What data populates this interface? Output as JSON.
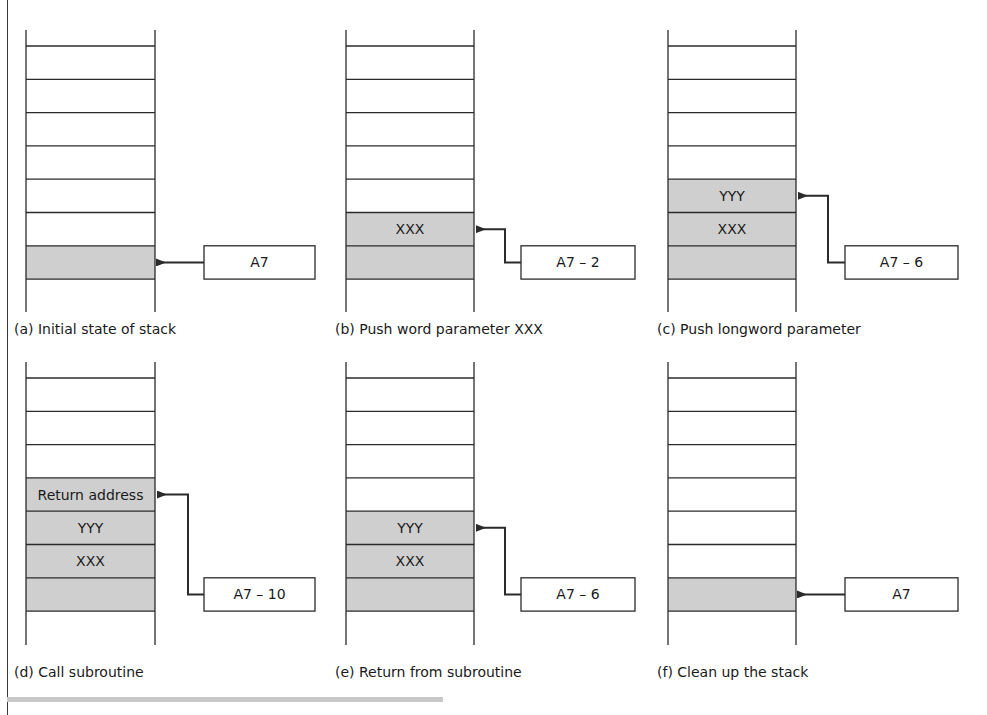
{
  "figure": {
    "colors": {
      "line": "#2b2b2b",
      "shade": "#cfcfcf",
      "background": "#ffffff",
      "bottom_bar": "#c8c8c8"
    },
    "panels": [
      {
        "id": "a",
        "caption": "(a) Initial state of stack",
        "pointer_label": "A7",
        "shaded_rows": 1,
        "cells": [],
        "pointer_target_row": 0,
        "elbow": false
      },
      {
        "id": "b",
        "caption": "(b) Push word parameter XXX",
        "pointer_label": "A7 – 2",
        "shaded_rows": 2,
        "cells": [
          "XXX"
        ],
        "pointer_target_row": 1,
        "elbow": true
      },
      {
        "id": "c",
        "caption": "(c) Push longword parameter",
        "pointer_label": "A7 – 6",
        "shaded_rows": 3,
        "cells": [
          "XXX",
          "YYY"
        ],
        "pointer_target_row": 2,
        "elbow": true
      },
      {
        "id": "d",
        "caption": "(d) Call subroutine",
        "pointer_label": "A7 – 10",
        "shaded_rows": 4,
        "cells": [
          "XXX",
          "YYY",
          "Return address"
        ],
        "pointer_target_row": 3,
        "elbow": true
      },
      {
        "id": "e",
        "caption": "(e) Return from subroutine",
        "pointer_label": "A7 – 6",
        "shaded_rows": 3,
        "cells": [
          "XXX",
          "YYY"
        ],
        "pointer_target_row": 2,
        "elbow": true
      },
      {
        "id": "f",
        "caption": "(f) Clean up the stack",
        "pointer_label": "A7",
        "shaded_rows": 1,
        "cells": [],
        "pointer_target_row": 0,
        "elbow": false
      }
    ]
  }
}
